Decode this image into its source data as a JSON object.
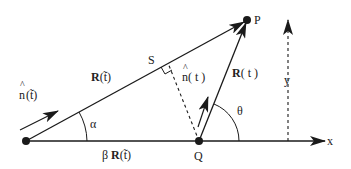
{
  "diagram": {
    "type": "geometry-vector-diagram",
    "colors": {
      "stroke": "#1a1a1a",
      "background": "#ffffff"
    },
    "points": {
      "origin": {
        "x": 26,
        "y": 141
      },
      "Q": {
        "x": 199,
        "y": 141,
        "label": "Q"
      },
      "P": {
        "x": 247,
        "y": 20,
        "label": "P"
      },
      "S": {
        "x": 168,
        "y": 63,
        "label": "S"
      }
    },
    "labels": {
      "n_hat_tilde": {
        "hat": "^",
        "base": "n",
        "arg": "(t̃)"
      },
      "R_tilde": {
        "bold": "R",
        "arg": "(t̃)"
      },
      "alpha": "α",
      "beta_R_tilde": {
        "prefix": "β ",
        "bold": "R",
        "arg": "(t̃)"
      },
      "n_hat_t": {
        "hat": "^",
        "base": "n",
        "arg": "( t )"
      },
      "R_t": {
        "bold": "R",
        "arg": "( t )"
      },
      "theta": "θ",
      "x_axis": "x",
      "y_axis": "y",
      "S": "S",
      "Q": "Q",
      "P": "P"
    }
  }
}
